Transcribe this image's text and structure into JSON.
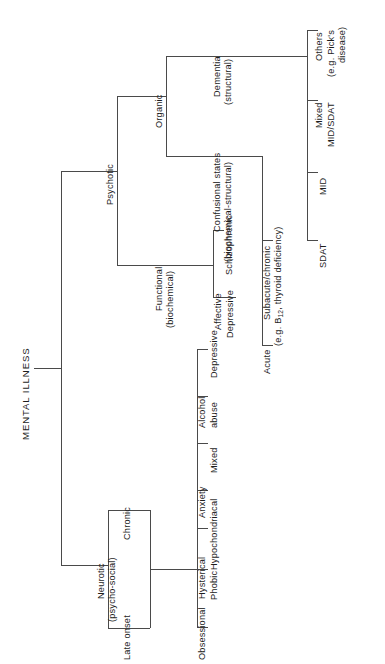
{
  "diagram": {
    "title": "MENTAL ILLNESS",
    "type": "hierarchical-tree",
    "orientation": "rotated-90-counterclockwise",
    "background_color": "#ffffff",
    "line_color": "#4a4a4a",
    "text_color": "#1d1d1d"
  },
  "nodes": {
    "root": {
      "label": "MENTAL ILLNESS"
    },
    "psychotic": {
      "label": "Psychotic"
    },
    "neurotic": {
      "label": "Neurotic",
      "sub": "(psycho-social)"
    },
    "organic": {
      "label": "Organic"
    },
    "functional": {
      "label": "Functional",
      "sub": "(biochemical)"
    },
    "dementia": {
      "label": "Dementia",
      "sub": "(structural)"
    },
    "confusional": {
      "label": "Confusional states",
      "sub": "(biochemical-structural)"
    },
    "affective": {
      "label": "Affective"
    },
    "schizophrenic": {
      "label": "Schizophrenic"
    },
    "depressive": {
      "label": "Depressive"
    },
    "acute": {
      "label": "Acute"
    },
    "subacute": {
      "label": "Subacute/chronic",
      "sub_pre": "(e.g. B",
      "sub_script": "12",
      "sub_post": ", thyroid deficiency)"
    },
    "sdat": {
      "label": "SDAT"
    },
    "mid": {
      "label": "MID"
    },
    "mixed_mid_sdat": {
      "label": "Mixed",
      "sub": "MID/SDAT"
    },
    "others": {
      "label": "Others",
      "sub": "(e.g. Pick's",
      "sub2": "disease)"
    },
    "late_onset": {
      "label": "Late onset"
    },
    "chronic": {
      "label": "Chronic"
    },
    "obsessional": {
      "label": "Obsessional"
    },
    "phobic": {
      "label": "Phobic"
    },
    "hysterical": {
      "label": "Hysterical"
    },
    "hypochondriacal": {
      "label": "Hypochondriacal"
    },
    "anxiety": {
      "label": "Anxiety"
    },
    "mixed": {
      "label": "Mixed"
    },
    "alcohol_abuse": {
      "label": "Alcohol",
      "sub": "abuse"
    }
  }
}
